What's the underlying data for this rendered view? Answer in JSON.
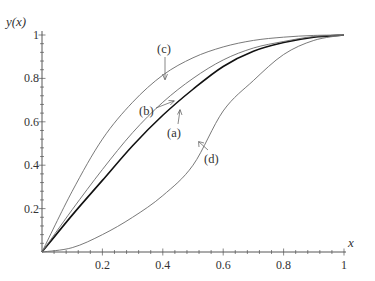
{
  "chart_data": {
    "type": "line",
    "title": "",
    "xlabel": "x",
    "ylabel": "y(x)",
    "xlim": [
      0,
      1
    ],
    "ylim": [
      0,
      1
    ],
    "grid": false,
    "legend": "none (curves labelled inline with arrows)",
    "x_ticks": [
      "0.2",
      "0.4",
      "0.6",
      "0.8",
      "1"
    ],
    "y_ticks": [
      "0.2",
      "0.4",
      "0.6",
      "0.8",
      "1"
    ],
    "x": [
      0,
      0.1,
      0.2,
      0.3,
      0.4,
      0.5,
      0.6,
      0.7,
      0.8,
      0.9,
      1.0
    ],
    "series": [
      {
        "name": "(a)",
        "style": "thick black",
        "values": [
          0,
          0.17,
          0.33,
          0.49,
          0.63,
          0.75,
          0.855,
          0.925,
          0.965,
          0.99,
          1.0
        ]
      },
      {
        "name": "(b)",
        "style": "thin gray",
        "values": [
          0,
          0.195,
          0.38,
          0.55,
          0.69,
          0.8,
          0.885,
          0.94,
          0.97,
          0.993,
          1.0
        ]
      },
      {
        "name": "(c)",
        "style": "thin gray",
        "values": [
          0,
          0.28,
          0.52,
          0.69,
          0.815,
          0.895,
          0.945,
          0.975,
          0.99,
          0.998,
          1.0
        ]
      },
      {
        "name": "(d)",
        "style": "thin gray",
        "values": [
          0,
          0.02,
          0.08,
          0.16,
          0.26,
          0.4,
          0.65,
          0.79,
          0.91,
          0.975,
          1.0
        ]
      }
    ],
    "annotations": [
      {
        "text": "(a)",
        "points_to": "thick curve near x=0.45"
      },
      {
        "text": "(b)",
        "points_to": "curve near x=0.44"
      },
      {
        "text": "(c)",
        "points_to": "top curve near x=0.41"
      },
      {
        "text": "(d)",
        "points_to": "lowest curve near x=0.52"
      }
    ]
  },
  "labels": {
    "ylabel": "y(x)",
    "xlabel": "x",
    "a": "(a)",
    "b": "(b)",
    "c": "(c)",
    "d": "(d)"
  },
  "colors": {
    "main_curve": "#111111",
    "other_curves": "#6a6a6a",
    "axis": "#444444"
  }
}
